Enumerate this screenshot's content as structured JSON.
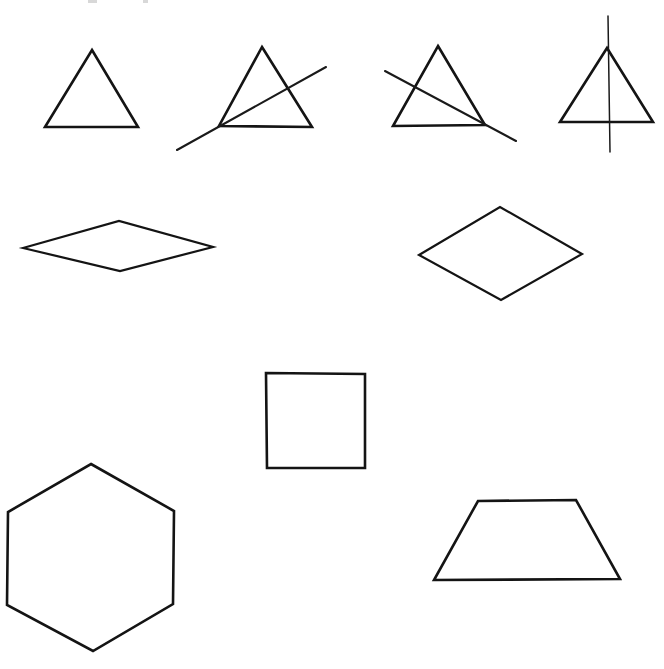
{
  "figure": {
    "background_color": "#ffffff",
    "stroke_color": "#141414",
    "width": 664,
    "height": 669,
    "row_count": 4,
    "shape_count": 9
  },
  "shapes": [
    {
      "id": "triangle-plain",
      "name": "triangle",
      "row": 1,
      "column": 1,
      "label": "Triangle",
      "kind": "polygon",
      "points": "92,50 138,127 45,127",
      "closed": true,
      "stroke_width": 2.6
    },
    {
      "id": "triangle-with-line-ascending",
      "name": "triangle with crossing line",
      "row": 1,
      "column": 2,
      "label": "Triangle crossed by ascending line",
      "kind": "polygon",
      "points": "262,47 312,127 219,126",
      "closed": true,
      "stroke_width": 2.6,
      "overlay_line": {
        "id": "line-ascending",
        "label": "Ascending diagonal line",
        "x1": 177,
        "y1": 150,
        "x2": 326,
        "y2": 67,
        "stroke_width": 2.1
      }
    },
    {
      "id": "triangle-with-line-descending",
      "name": "triangle with crossing line",
      "row": 1,
      "column": 3,
      "label": "Triangle crossed by descending line",
      "kind": "polygon",
      "points": "438,46 485,125 393,126",
      "closed": true,
      "stroke_width": 2.6,
      "overlay_line": {
        "id": "line-descending",
        "label": "Descending diagonal line",
        "x1": 385,
        "y1": 71,
        "x2": 516,
        "y2": 141,
        "stroke_width": 2.1
      }
    },
    {
      "id": "triangle-with-vertical-line",
      "name": "triangle with vertical line",
      "row": 1,
      "column": 4,
      "label": "Triangle bisected by vertical line",
      "kind": "polygon",
      "points": "607,48 653,122 560,122",
      "closed": true,
      "stroke_width": 2.6,
      "overlay_line": {
        "id": "line-vertical",
        "label": "Vertical line",
        "x1": 608,
        "y1": 16,
        "x2": 610,
        "y2": 152,
        "stroke_width": 1.5
      }
    },
    {
      "id": "rhombus-flat",
      "name": "rhombus",
      "row": 2,
      "column": 1,
      "label": "Flat wide rhombus",
      "kind": "polygon",
      "points": "23,248 119,221 213,247 120,271",
      "closed": true,
      "stroke_width": 2.2
    },
    {
      "id": "rhombus-tall",
      "name": "rhombus",
      "row": 2,
      "column": 2,
      "label": "Tall rhombus",
      "kind": "polygon",
      "points": "419,255 500,207 582,254 501,300",
      "closed": true,
      "stroke_width": 2.2
    },
    {
      "id": "square",
      "name": "square",
      "row": 3,
      "column": 1,
      "label": "Square",
      "kind": "polygon",
      "points": "266,373 365,374 365,468 267,468",
      "closed": true,
      "stroke_width": 2.4
    },
    {
      "id": "hexagon",
      "name": "hexagon",
      "row": 4,
      "column": 1,
      "label": "Regular hexagon",
      "kind": "polygon",
      "points": "91,464 174,511 173,604 93,651 7,605 8,512",
      "closed": true,
      "stroke_width": 2.4
    },
    {
      "id": "trapezoid",
      "name": "trapezoid",
      "row": 4,
      "column": 2,
      "label": "Trapezoid",
      "kind": "polygon",
      "points": "478,501 576,500 620,579 434,580",
      "closed": true,
      "stroke_width": 2.6
    }
  ],
  "faint_marks": [
    {
      "id": "faint-mark-left",
      "x": 88,
      "y": 0,
      "width": 9,
      "height": 3
    },
    {
      "id": "faint-mark-right",
      "x": 143,
      "y": 0,
      "width": 5,
      "height": 3
    }
  ]
}
